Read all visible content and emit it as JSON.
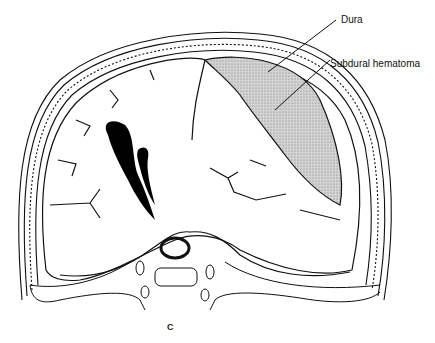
{
  "figure": {
    "panel_letter": "C",
    "labels": [
      {
        "id": "dura",
        "text": "Dura"
      },
      {
        "id": "subdural_hematoma",
        "text": "Subdural hematoma"
      }
    ],
    "colors": {
      "line": "#111111",
      "hematoma_fill": "#bdbdbd",
      "ventricle_fill": "#000000",
      "background": "#ffffff"
    }
  }
}
